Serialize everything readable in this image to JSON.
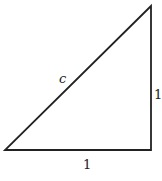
{
  "diagram": {
    "type": "right-triangle",
    "vertices": {
      "top": [
        151,
        6
      ],
      "bottom_left": [
        5,
        150
      ],
      "bottom_right": [
        151,
        150
      ]
    },
    "stroke_color": "#222222",
    "labels": {
      "hypotenuse": "c",
      "base": "1",
      "height": "1"
    }
  }
}
